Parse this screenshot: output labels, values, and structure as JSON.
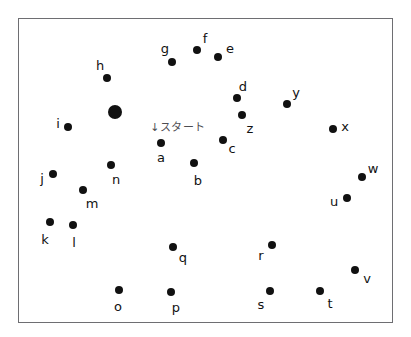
{
  "page": {
    "background_color": "#ffffff",
    "width": 411,
    "height": 337
  },
  "frame": {
    "x": 18,
    "y": 18,
    "width": 375,
    "height": 305,
    "border_color": "#6e6e72",
    "fill_color": "#ffffff"
  },
  "annotation": {
    "text": "↓スタート",
    "romaji_meaning": "Start",
    "x": 178,
    "y": 127,
    "color": "#4d4d52"
  },
  "dot_style": {
    "color": "#111111",
    "normal_radius": 4,
    "start_radius": 7
  },
  "dots": [
    {
      "label": "start",
      "show_label": false,
      "x": 115,
      "y": 112,
      "r": 7,
      "lx": 0,
      "ly": 0
    },
    {
      "label": "a",
      "show_label": true,
      "x": 161,
      "y": 143,
      "r": 4,
      "lx": 161,
      "ly": 157
    },
    {
      "label": "b",
      "show_label": true,
      "x": 194,
      "y": 163,
      "r": 4,
      "lx": 198,
      "ly": 180
    },
    {
      "label": "c",
      "show_label": true,
      "x": 223,
      "y": 140,
      "r": 4,
      "lx": 232,
      "ly": 148
    },
    {
      "label": "d",
      "show_label": true,
      "x": 237,
      "y": 98,
      "r": 4,
      "lx": 243,
      "ly": 86
    },
    {
      "label": "e",
      "show_label": true,
      "x": 218,
      "y": 57,
      "r": 4,
      "lx": 230,
      "ly": 48
    },
    {
      "label": "f",
      "show_label": true,
      "x": 197,
      "y": 50,
      "r": 4,
      "lx": 205,
      "ly": 38
    },
    {
      "label": "g",
      "show_label": true,
      "x": 172,
      "y": 62,
      "r": 4,
      "lx": 165,
      "ly": 48
    },
    {
      "label": "h",
      "show_label": true,
      "x": 107,
      "y": 78,
      "r": 4,
      "lx": 100,
      "ly": 65
    },
    {
      "label": "i",
      "show_label": true,
      "x": 68,
      "y": 127,
      "r": 4,
      "lx": 58,
      "ly": 123
    },
    {
      "label": "j",
      "show_label": true,
      "x": 53,
      "y": 174,
      "r": 4,
      "lx": 42,
      "ly": 178
    },
    {
      "label": "k",
      "show_label": true,
      "x": 50,
      "y": 222,
      "r": 4,
      "lx": 45,
      "ly": 239
    },
    {
      "label": "l",
      "show_label": true,
      "x": 73,
      "y": 225,
      "r": 4,
      "lx": 74,
      "ly": 242
    },
    {
      "label": "m",
      "show_label": true,
      "x": 83,
      "y": 190,
      "r": 4,
      "lx": 92,
      "ly": 203
    },
    {
      "label": "n",
      "show_label": true,
      "x": 111,
      "y": 165,
      "r": 4,
      "lx": 116,
      "ly": 179
    },
    {
      "label": "o",
      "show_label": true,
      "x": 119,
      "y": 290,
      "r": 4,
      "lx": 118,
      "ly": 306
    },
    {
      "label": "p",
      "show_label": true,
      "x": 171,
      "y": 292,
      "r": 4,
      "lx": 176,
      "ly": 307
    },
    {
      "label": "q",
      "show_label": true,
      "x": 173,
      "y": 247,
      "r": 4,
      "lx": 183,
      "ly": 257
    },
    {
      "label": "r",
      "show_label": true,
      "x": 272,
      "y": 245,
      "r": 4,
      "lx": 261,
      "ly": 255
    },
    {
      "label": "s",
      "show_label": true,
      "x": 270,
      "y": 291,
      "r": 4,
      "lx": 261,
      "ly": 304
    },
    {
      "label": "t",
      "show_label": true,
      "x": 320,
      "y": 291,
      "r": 4,
      "lx": 330,
      "ly": 303
    },
    {
      "label": "u",
      "show_label": true,
      "x": 347,
      "y": 198,
      "r": 4,
      "lx": 334,
      "ly": 201
    },
    {
      "label": "v",
      "show_label": true,
      "x": 355,
      "y": 270,
      "r": 4,
      "lx": 367,
      "ly": 278
    },
    {
      "label": "w",
      "show_label": true,
      "x": 362,
      "y": 177,
      "r": 4,
      "lx": 373,
      "ly": 168
    },
    {
      "label": "x",
      "show_label": true,
      "x": 333,
      "y": 129,
      "r": 4,
      "lx": 345,
      "ly": 126
    },
    {
      "label": "y",
      "show_label": true,
      "x": 287,
      "y": 104,
      "r": 4,
      "lx": 296,
      "ly": 92
    },
    {
      "label": "z",
      "show_label": true,
      "x": 242,
      "y": 115,
      "r": 4,
      "lx": 250,
      "ly": 128
    }
  ]
}
